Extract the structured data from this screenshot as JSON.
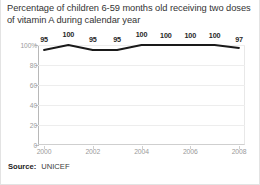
{
  "chart_data": {
    "type": "line",
    "title": "Percentage of children 6-59 months old receiving two doses of vitamin A during calendar year",
    "xlabel": "",
    "ylabel": "",
    "x": [
      2000,
      2001,
      2002,
      2003,
      2004,
      2005,
      2006,
      2007,
      2008
    ],
    "values": [
      95,
      100,
      95,
      95,
      100,
      100,
      100,
      100,
      97
    ],
    "point_labels": [
      "95",
      "100",
      "95",
      "95",
      "100",
      "100",
      "100",
      "100",
      "97"
    ],
    "xlim": [
      2000,
      2008
    ],
    "ylim": [
      0,
      100
    ],
    "x_tick_labels": [
      "2000",
      "2002",
      "2004",
      "2006",
      "2008"
    ],
    "x_tick_values": [
      2000,
      2002,
      2004,
      2006,
      2008
    ],
    "y_tick_labels": [
      "100%",
      "80",
      "60",
      "40",
      "20",
      "0"
    ],
    "y_tick_values": [
      100,
      80,
      60,
      40,
      20,
      0
    ],
    "grid": true,
    "legend": false,
    "series_color": "#1a1a1a",
    "grid_color": "#ededed",
    "label_color": "#9a9a9a"
  },
  "source": {
    "label": "Source:",
    "value": "UNICEF"
  }
}
